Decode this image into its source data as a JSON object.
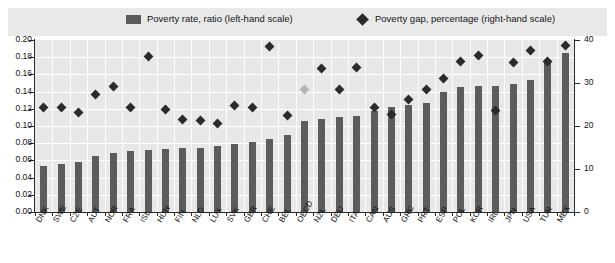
{
  "legend": {
    "items": [
      {
        "marker": "bar-swatch-icon",
        "label": "Poverty rate, ratio (left-hand scale)"
      },
      {
        "marker": "diamond-marker-icon",
        "label": "Poverty gap, percentage (right-hand scale)"
      }
    ]
  },
  "axes": {
    "left_ticks": [
      "0.20",
      "0.18",
      "0.16",
      "0.14",
      "0.12",
      "0.10",
      "0.08",
      "0.06",
      "0.04",
      "0.02",
      "0.00"
    ],
    "right_ticks": [
      "40",
      "30",
      "20",
      "10",
      "0"
    ],
    "left_min": 0.0,
    "left_max": 0.2,
    "right_min": 0,
    "right_max": 40
  },
  "colors": {
    "bar": "#5c5c5c",
    "diamond": "#2b2b2b",
    "diamond_highlight": "#b4b4b4",
    "plot_background": "#e8e8e8",
    "legend_background": "#e9e9e9",
    "gridline": "#ffffff",
    "axis": "#2b2b2b"
  },
  "chart_data": {
    "type": "bar",
    "title": "",
    "xlabel": "",
    "ylabel": "Poverty rate, ratio",
    "ylabel_right": "Poverty gap, percentage",
    "ylim": [
      0,
      0.2
    ],
    "ylim_right": [
      0,
      40
    ],
    "grid": true,
    "legend_position": "top",
    "categories": [
      "DNK",
      "SWE",
      "CZE",
      "AUT",
      "NOR",
      "FRA",
      "ISL",
      "HUN",
      "FIN",
      "NLD",
      "LUX",
      "SVK",
      "GBR",
      "CHE",
      "BEL",
      "OECD",
      "NZL",
      "DEU",
      "ITA",
      "CAN",
      "AUS",
      "GRC",
      "PRT",
      "ESP",
      "POL",
      "KOR",
      "IRL",
      "JPN",
      "USA",
      "TUR",
      "MEX"
    ],
    "series": [
      {
        "name": "Poverty rate, ratio (left-hand scale)",
        "type": "bar",
        "axis": "left",
        "values": [
          0.053,
          0.056,
          0.058,
          0.065,
          0.069,
          0.071,
          0.072,
          0.073,
          0.074,
          0.075,
          0.077,
          0.079,
          0.081,
          0.085,
          0.089,
          0.106,
          0.108,
          0.11,
          0.112,
          0.118,
          0.122,
          0.124,
          0.127,
          0.14,
          0.145,
          0.146,
          0.147,
          0.149,
          0.154,
          0.173,
          0.185
        ]
      },
      {
        "name": "Poverty gap, percentage (right-hand scale)",
        "type": "scatter",
        "axis": "right",
        "values": [
          24.2,
          24.2,
          23.2,
          27.4,
          29.2,
          24.4,
          36.2,
          23.8,
          21.4,
          21.2,
          20.6,
          24.8,
          24.4,
          38.6,
          22.4,
          28.6,
          33.4,
          28.4,
          33.6,
          24.2,
          22.6,
          26.2,
          28.4,
          31.0,
          35.0,
          36.4,
          23.6,
          34.8,
          37.6,
          35.0,
          38.8
        ],
        "highlight_index": 15
      }
    ]
  }
}
